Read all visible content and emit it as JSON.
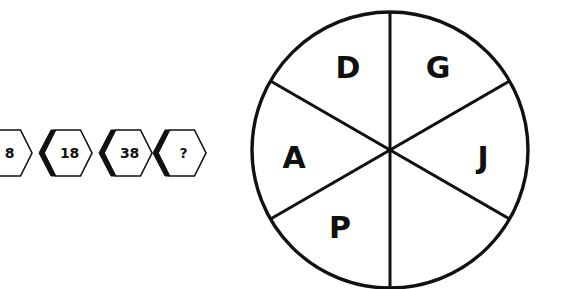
{
  "background_color": "#ffffff",
  "stroke_color": "#111111",
  "puzzle": {
    "sequence": {
      "shape": "hexagon",
      "items": [
        {
          "value": "8",
          "x": -18
        },
        {
          "value": "18",
          "x": 42
        },
        {
          "value": "38",
          "x": 102
        },
        {
          "value": "?",
          "x": 156
        }
      ]
    },
    "wheel": {
      "center_x": 145,
      "center_y": 150,
      "radius": 138,
      "sector_count": 6,
      "sectors": [
        {
          "label": "D",
          "x": 103,
          "y": 68
        },
        {
          "label": "G",
          "x": 193,
          "y": 68
        },
        {
          "label": "A",
          "x": 49,
          "y": 158
        },
        {
          "label": "J",
          "x": 238,
          "y": 158
        },
        {
          "label": "P",
          "x": 95,
          "y": 228
        },
        {
          "label": "",
          "x": 200,
          "y": 228
        }
      ]
    }
  }
}
